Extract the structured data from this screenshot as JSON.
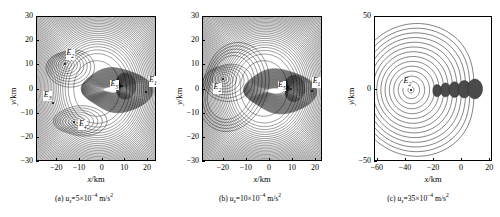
{
  "figure": {
    "background": "#ffffff",
    "line_color": "#000000",
    "panel_count": 3
  },
  "panels": [
    {
      "id": "a",
      "caption_prefix": "(a) ",
      "caption_var": "u",
      "caption_sub": "s",
      "caption_value": "=5",
      "caption_mult": "×10",
      "caption_exp": "−4",
      "caption_unit": " m/s",
      "caption_unit_exp": "2",
      "caption_full": "(a) us=5×10−4 m/s2",
      "xlabel_var": "x",
      "xlabel_unit": "/km",
      "ylabel_var": "y",
      "ylabel_unit": "/km",
      "xticks": [
        "-20",
        "-10",
        "0",
        "10",
        "20"
      ],
      "xtick_values": [
        -20,
        -10,
        0,
        10,
        20
      ],
      "yticks": [
        "30",
        "20",
        "10",
        "0",
        "-10",
        "-20",
        "-30"
      ],
      "ytick_values": [
        30,
        20,
        10,
        0,
        -10,
        -20,
        -30
      ],
      "xlim": [
        -29,
        24
      ],
      "ylim": [
        -30,
        30
      ],
      "points": [
        {
          "label": "E",
          "sub": "1",
          "x": 19.5,
          "y": -1.5,
          "lx": 22.5,
          "ly": 3.5
        },
        {
          "label": "E",
          "sub": "2",
          "x": -16.0,
          "y": 10.0,
          "lx": -14.0,
          "ly": 14.5
        },
        {
          "label": "E",
          "sub": "3",
          "x": -21.5,
          "y": -6.0,
          "lx": -24.0,
          "ly": -2.5
        },
        {
          "label": "E",
          "sub": "4",
          "x": -12.0,
          "y": -14.0,
          "lx": -8.5,
          "ly": -14.5
        },
        {
          "label": "E",
          "sub": "5",
          "x": 9.0,
          "y": 1.0,
          "lx": 5.5,
          "ly": 2.0
        }
      ]
    },
    {
      "id": "b",
      "caption_prefix": "(b) ",
      "caption_var": "u",
      "caption_sub": "s",
      "caption_value": "=10",
      "caption_mult": "×10",
      "caption_exp": "−4",
      "caption_unit": " m/s",
      "caption_unit_exp": "2",
      "caption_full": "(b) us=10×10−4 m/s2",
      "xlabel_var": "x",
      "xlabel_unit": "/km",
      "ylabel_var": "y",
      "ylabel_unit": "/km",
      "xticks": [
        "-20",
        "-10",
        "0",
        "10",
        "20"
      ],
      "xtick_values": [
        -20,
        -10,
        0,
        10,
        20
      ],
      "yticks": [
        "30",
        "20",
        "10",
        "0",
        "-10",
        "-20",
        "-30"
      ],
      "ytick_values": [
        30,
        20,
        10,
        0,
        -10,
        -20,
        -30
      ],
      "xlim": [
        -29,
        23
      ],
      "ylim": [
        -30,
        30
      ],
      "points": [
        {
          "label": "E",
          "sub": "1",
          "x": 18.5,
          "y": -1.0,
          "lx": 20.5,
          "ly": 3.0
        },
        {
          "label": "E",
          "sub": "2",
          "x": -20.0,
          "y": 4.0,
          "lx": -22.5,
          "ly": 0.5
        },
        {
          "label": "E",
          "sub": "5",
          "x": 9.5,
          "y": 0.0,
          "lx": 5.5,
          "ly": 1.5
        }
      ]
    },
    {
      "id": "c",
      "caption_prefix": "(c) ",
      "caption_var": "u",
      "caption_sub": "s",
      "caption_value": "=35",
      "caption_mult": "×10",
      "caption_exp": "−4",
      "caption_unit": " m/s",
      "caption_unit_exp": "2",
      "caption_full": "(c) us=35×10−4 m/s2",
      "xlabel_var": "x",
      "xlabel_unit": "/km",
      "ylabel_var": "y",
      "ylabel_unit": "/km",
      "xticks": [
        "-60",
        "-40",
        "-20",
        "0",
        "20"
      ],
      "xtick_values": [
        -60,
        -40,
        -20,
        0,
        20
      ],
      "yticks": [
        "50",
        "0",
        "-50"
      ],
      "ytick_values": [
        50,
        0,
        -50
      ],
      "xlim": [
        -62,
        22
      ],
      "ylim": [
        -50,
        50
      ],
      "points": [
        {
          "label": "E",
          "sub": "2",
          "x": -36.0,
          "y": -1.0,
          "lx": -38.5,
          "ly": 5.0
        }
      ]
    }
  ],
  "chart_data": {
    "type": "contour",
    "title": "",
    "xlabel": "x/km",
    "ylabel": "y/km",
    "grid": false,
    "legend": "none",
    "subplots": [
      {
        "name": "(a) us=5×10−4 m/s2",
        "parameter": "u_s",
        "parameter_value": 5,
        "parameter_scale": "×10−4",
        "parameter_unit": "m/s2",
        "xlim": [
          -29,
          24
        ],
        "ylim": [
          -30,
          30
        ],
        "xticks": [
          -20,
          -10,
          0,
          10,
          20
        ],
        "yticks": [
          -30,
          -20,
          -10,
          0,
          10,
          20,
          30
        ],
        "equilibrium_points": [
          {
            "name": "E1",
            "x": 19.5,
            "y": -1.5
          },
          {
            "name": "E2",
            "x": -16.0,
            "y": 10.0
          },
          {
            "name": "E3",
            "x": -21.5,
            "y": -6.0
          },
          {
            "name": "E4",
            "x": -12.0,
            "y": -14.0
          },
          {
            "name": "E5",
            "x": 9.0,
            "y": 1.0
          }
        ]
      },
      {
        "name": "(b) us=10×10−4 m/s2",
        "parameter": "u_s",
        "parameter_value": 10,
        "parameter_scale": "×10−4",
        "parameter_unit": "m/s2",
        "xlim": [
          -29,
          23
        ],
        "ylim": [
          -30,
          30
        ],
        "xticks": [
          -20,
          -10,
          0,
          10,
          20
        ],
        "yticks": [
          -30,
          -20,
          -10,
          0,
          10,
          20,
          30
        ],
        "equilibrium_points": [
          {
            "name": "E1",
            "x": 18.5,
            "y": -1.0
          },
          {
            "name": "E2",
            "x": -20.0,
            "y": 4.0
          },
          {
            "name": "E5",
            "x": 9.5,
            "y": 0.0
          }
        ]
      },
      {
        "name": "(c) us=35×10−4 m/s2",
        "parameter": "u_s",
        "parameter_value": 35,
        "parameter_scale": "×10−4",
        "parameter_unit": "m/s2",
        "xlim": [
          -62,
          22
        ],
        "ylim": [
          -50,
          50
        ],
        "xticks": [
          -60,
          -40,
          -20,
          0,
          20
        ],
        "yticks": [
          -50,
          0,
          50
        ],
        "equilibrium_points": [
          {
            "name": "E2",
            "x": -36.0,
            "y": -1.0
          }
        ]
      }
    ]
  }
}
